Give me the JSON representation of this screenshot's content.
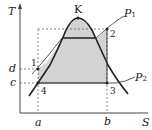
{
  "diagram": {
    "type": "T-S diagram",
    "axes": {
      "y_label": "T",
      "x_label": "S"
    },
    "critical_point": "K",
    "isobars": [
      {
        "label": "P",
        "sub": "1"
      },
      {
        "label": "P",
        "sub": "2"
      }
    ],
    "points": [
      "1",
      "2",
      "3",
      "4"
    ],
    "x_ticks": [
      "a",
      "b"
    ],
    "y_ticks": [
      "d",
      "c"
    ],
    "colors": {
      "fill": "#d3d3d3",
      "line": "#222222",
      "dash": "#555555"
    }
  }
}
